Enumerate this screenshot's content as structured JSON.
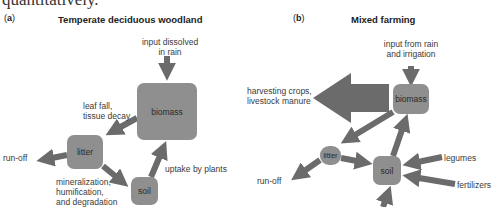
{
  "intro_text": "quantitatively.",
  "colors": {
    "box_fill": "#8f8f8f",
    "arrow_fill": "#6b6b6b",
    "label_text": "#3a3a3a"
  },
  "panel_a": {
    "tag_open": "(",
    "tag_letter": "a",
    "tag_close": ")",
    "title": "Temperate deciduous woodland",
    "nodes": {
      "biomass": "biomass",
      "litter": "litter",
      "soil": "soil"
    },
    "flows": {
      "input": [
        "input dissolved",
        "in rain"
      ],
      "leaf_fall": [
        "leaf fall,",
        "tissue decay"
      ],
      "run_off": "run-off",
      "mineralization": [
        "mineralization,",
        "humification,",
        "and degradation"
      ],
      "uptake": "uptake by plants"
    }
  },
  "panel_b": {
    "tag_open": "(",
    "tag_letter": "b",
    "tag_close": ")",
    "title": "Mixed farming",
    "nodes": {
      "biomass": "biomass",
      "litter": "litter",
      "soil": "soil"
    },
    "flows": {
      "input": [
        "input from rain",
        "and irrigation"
      ],
      "harvest": [
        "harvesting crops,",
        "livestock manure"
      ],
      "run_off": "run-off",
      "legumes": "legumes",
      "fertilizers": "fertilizers"
    }
  }
}
